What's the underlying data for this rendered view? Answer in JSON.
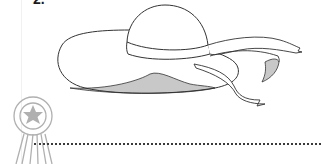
{
  "worksheet": {
    "item_number": "2.",
    "illustration": "sun-hat-with-ribbon",
    "badge": "star-rosette-award",
    "answer_line": "dotted-writing-line"
  },
  "colors": {
    "outline": "#333333",
    "shade": "#c8c8c8",
    "badge_gray": "#b0b0b0",
    "dots": "#3a3a3a"
  }
}
